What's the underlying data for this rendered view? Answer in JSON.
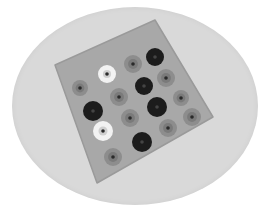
{
  "image": {
    "description": "Grayscale photo of a square felt cushion decorated with circular felt appliqués, shown inside a light gray oval",
    "colors": {
      "background": "#ffffff",
      "oval": "#d9d9d9",
      "cushion": "#a8a8a8",
      "cushion_edge": "#9a9a9a",
      "circle_black": "#1c1c1c",
      "circle_gray": "#8d8d8d",
      "circle_gray_inner": "#7a7a7a",
      "circle_white": "#f2f2f2",
      "center_dot": "#2a2a2a"
    },
    "cushion": {
      "points": "55,65 155,20 213,117 97,183"
    },
    "circles": [
      {
        "cx": 155,
        "cy": 57,
        "r": 9,
        "tone": "black"
      },
      {
        "cx": 133,
        "cy": 64,
        "r": 9,
        "tone": "gray"
      },
      {
        "cx": 107,
        "cy": 74,
        "r": 9,
        "tone": "white"
      },
      {
        "cx": 166,
        "cy": 78,
        "r": 9,
        "tone": "gray"
      },
      {
        "cx": 144,
        "cy": 86,
        "r": 9,
        "tone": "black"
      },
      {
        "cx": 80,
        "cy": 88,
        "r": 8,
        "tone": "gray"
      },
      {
        "cx": 119,
        "cy": 97,
        "r": 9,
        "tone": "gray"
      },
      {
        "cx": 181,
        "cy": 98,
        "r": 8,
        "tone": "gray"
      },
      {
        "cx": 157,
        "cy": 107,
        "r": 10,
        "tone": "black"
      },
      {
        "cx": 93,
        "cy": 111,
        "r": 10,
        "tone": "black"
      },
      {
        "cx": 130,
        "cy": 118,
        "r": 9,
        "tone": "gray"
      },
      {
        "cx": 192,
        "cy": 117,
        "r": 9,
        "tone": "gray"
      },
      {
        "cx": 103,
        "cy": 131,
        "r": 10,
        "tone": "white"
      },
      {
        "cx": 168,
        "cy": 128,
        "r": 9,
        "tone": "gray"
      },
      {
        "cx": 142,
        "cy": 142,
        "r": 10,
        "tone": "black"
      },
      {
        "cx": 113,
        "cy": 157,
        "r": 9,
        "tone": "gray"
      }
    ]
  }
}
